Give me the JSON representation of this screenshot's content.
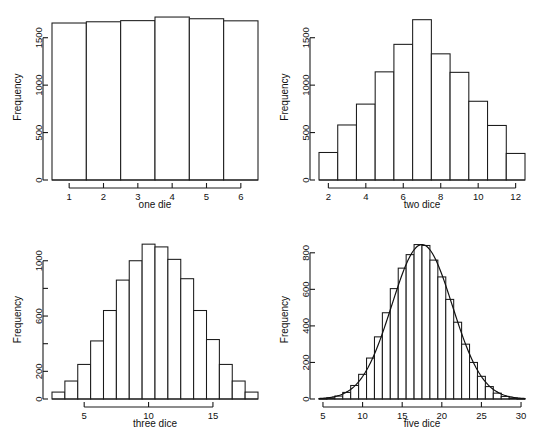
{
  "figure": {
    "layout": "2x2 panel grid",
    "background": "#ffffff",
    "foreground": "#1a1a1a"
  },
  "chart_data": [
    {
      "type": "bar",
      "panel": "top-left",
      "name": "one-die-histogram",
      "title": "",
      "xlabel": "one die",
      "ylabel": "Frequency",
      "categories": [
        1,
        2,
        3,
        4,
        5,
        6
      ],
      "values": [
        1655,
        1668,
        1680,
        1718,
        1700,
        1678
      ],
      "xlim": [
        0.5,
        6.5
      ],
      "ylim": [
        0,
        1750
      ],
      "xticks": [
        1,
        2,
        3,
        4,
        5,
        6
      ],
      "xtick_labels": [
        "1",
        "2",
        "3",
        "4",
        "5",
        "6"
      ],
      "yticks": [
        0,
        500,
        1000,
        1500
      ],
      "ytick_labels": [
        "0",
        "500",
        "1000",
        "1500"
      ],
      "bin_width": 1,
      "grid": false,
      "legend": false,
      "density_overlay": false
    },
    {
      "type": "bar",
      "panel": "top-right",
      "name": "two-dice-histogram",
      "title": "",
      "xlabel": "two dice",
      "ylabel": "Frequency",
      "categories": [
        2,
        3,
        4,
        5,
        6,
        7,
        8,
        9,
        10,
        11,
        12
      ],
      "values": [
        290,
        580,
        800,
        1140,
        1430,
        1690,
        1330,
        1135,
        830,
        575,
        280
      ],
      "xlim": [
        1.5,
        12.5
      ],
      "ylim": [
        0,
        1750
      ],
      "xticks": [
        2,
        4,
        6,
        8,
        10,
        12
      ],
      "xtick_labels": [
        "2",
        "4",
        "6",
        "8",
        "10",
        "12"
      ],
      "yticks": [
        0,
        500,
        1000,
        1500
      ],
      "ytick_labels": [
        "0",
        "500",
        "1000",
        "1500"
      ],
      "bin_width": 1,
      "grid": false,
      "legend": false,
      "density_overlay": false
    },
    {
      "type": "bar",
      "panel": "bottom-left",
      "name": "three-dice-histogram",
      "title": "",
      "xlabel": "three dice",
      "ylabel": "Frequency",
      "categories": [
        3,
        4,
        5,
        6,
        7,
        8,
        9,
        10,
        11,
        12,
        13,
        14,
        15,
        16,
        17,
        18
      ],
      "values": [
        50,
        130,
        250,
        420,
        640,
        860,
        1000,
        1120,
        1100,
        1010,
        870,
        640,
        430,
        250,
        130,
        50
      ],
      "xlim": [
        2.5,
        18.5
      ],
      "ylim": [
        0,
        1150
      ],
      "xticks": [
        5,
        10,
        15
      ],
      "xtick_labels": [
        "5",
        "10",
        "15"
      ],
      "yticks": [
        0,
        200,
        400,
        600,
        800,
        1000
      ],
      "ytick_labels": [
        "0",
        "200",
        "",
        "600",
        "",
        "1000"
      ],
      "bin_width": 1,
      "grid": false,
      "legend": false,
      "density_overlay": false
    },
    {
      "type": "bar",
      "panel": "bottom-right",
      "name": "five-dice-histogram",
      "title": "",
      "xlabel": "five dice",
      "ylabel": "Frequency",
      "categories": [
        5,
        6,
        7,
        8,
        9,
        10,
        11,
        12,
        13,
        14,
        15,
        16,
        17,
        18,
        19,
        20,
        21,
        22,
        23,
        24,
        25,
        26,
        27,
        28,
        29,
        30
      ],
      "values": [
        2,
        6,
        16,
        36,
        74,
        135,
        224,
        340,
        472,
        604,
        716,
        790,
        845,
        840,
        760,
        668,
        545,
        420,
        300,
        200,
        124,
        68,
        32,
        14,
        5,
        2
      ],
      "xlim": [
        4.5,
        30.5
      ],
      "ylim": [
        0,
        870
      ],
      "xticks": [
        5,
        10,
        15,
        20,
        25,
        30
      ],
      "xtick_labels": [
        "5",
        "10",
        "15",
        "20",
        "25",
        "30"
      ],
      "yticks": [
        0,
        200,
        400,
        600,
        800
      ],
      "ytick_labels": [
        "0",
        "200",
        "400",
        "600",
        "800"
      ],
      "bin_width": 1,
      "grid": false,
      "legend": false,
      "density_overlay": true,
      "density_curve": {
        "name": "normal-density-curve",
        "mean": 17.5,
        "sd": 3.82,
        "peak": 845
      }
    }
  ]
}
